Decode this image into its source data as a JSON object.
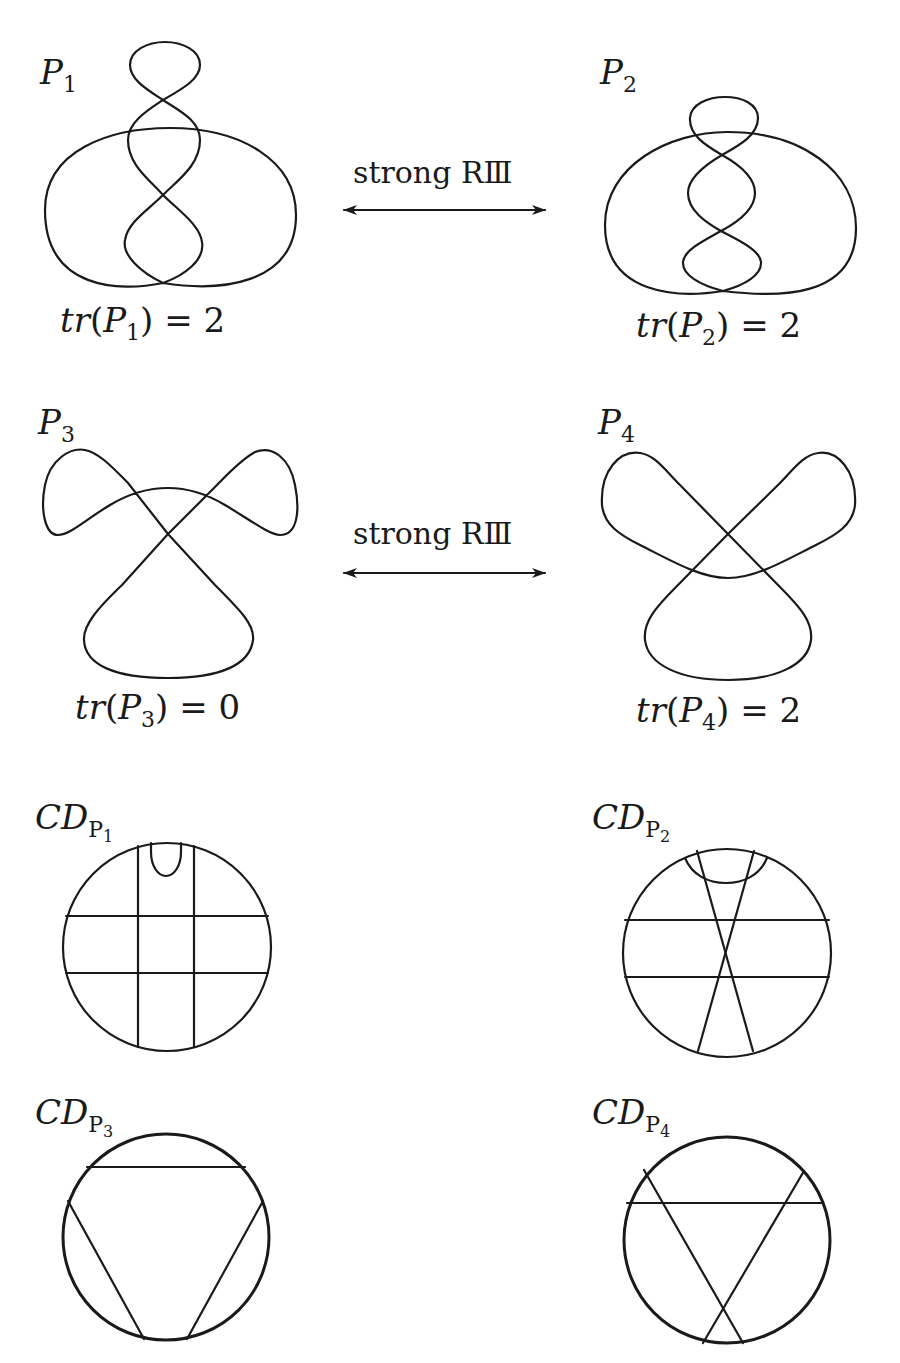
{
  "figure": {
    "rows": [
      {
        "left": {
          "name": "P",
          "index": "1",
          "trace_label": "tr",
          "trace_value": "2"
        },
        "move": {
          "label": "strong RⅢ",
          "arrow": "double-headed-arrow"
        },
        "right": {
          "name": "P",
          "index": "2",
          "trace_label": "tr",
          "trace_value": "2"
        }
      },
      {
        "left": {
          "name": "P",
          "index": "3",
          "trace_label": "tr",
          "trace_value": "0"
        },
        "move": {
          "label": "strong RⅢ",
          "arrow": "double-headed-arrow"
        },
        "right": {
          "name": "P",
          "index": "4",
          "trace_label": "tr",
          "trace_value": "2"
        }
      }
    ],
    "chord_diagrams": [
      {
        "prefix": "CD",
        "sub_name": "P",
        "sub_index": "1",
        "description": "two vertical and two horizontal chords forming a grid, plus a small isolated chord at the top"
      },
      {
        "prefix": "CD",
        "sub_name": "P",
        "sub_index": "2",
        "description": "two horizontal chords, two crossing chords, and a top arc chord"
      },
      {
        "prefix": "CD",
        "sub_name": "P",
        "sub_index": "3",
        "description": "three mutually non-crossing chords (triangle)"
      },
      {
        "prefix": "CD",
        "sub_name": "P",
        "sub_index": "4",
        "description": "three mutually crossing chords"
      }
    ],
    "equals": "=",
    "stroke_color": "#1a1a1a",
    "background": "#ffffff"
  }
}
